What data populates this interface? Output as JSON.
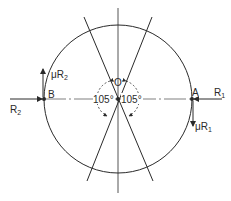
{
  "diagram": {
    "colors": {
      "line": "#2a2a2a",
      "background": "#ffffff"
    },
    "center": {
      "label": "O"
    },
    "points": [
      {
        "id": "A",
        "label": "A"
      },
      {
        "id": "B",
        "label": "B"
      }
    ],
    "forces": {
      "R1": {
        "label_main": "R",
        "label_sub": "1"
      },
      "R2": {
        "label_main": "R",
        "label_sub": "2"
      },
      "muR1": {
        "label_mu": "μ",
        "label_main": "R",
        "label_sub": "1"
      },
      "muR2": {
        "label_mu": "μ",
        "label_main": "R",
        "label_sub": "2"
      }
    },
    "angles": {
      "left": "105°",
      "right": "105°"
    }
  }
}
